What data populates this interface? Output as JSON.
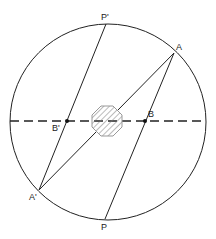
{
  "diagram": {
    "type": "geometric-optics",
    "circle": {
      "cx": 108,
      "cy": 122,
      "r": 98
    },
    "axis": {
      "y": 121,
      "x1": 10,
      "x2": 206,
      "style": "dashed"
    },
    "obstacle": {
      "shape": "octagon",
      "cx": 107,
      "cy": 121,
      "size": 30,
      "fill": "hatched"
    },
    "points": {
      "P_prime": {
        "label": "P'",
        "x": 106,
        "y": 24
      },
      "A": {
        "label": "A",
        "x": 174,
        "y": 53
      },
      "B": {
        "label": "B",
        "x": 145,
        "y": 121
      },
      "B_prime": {
        "label": "B'",
        "x": 67,
        "y": 121
      },
      "A_prime": {
        "label": "A'",
        "x": 39,
        "y": 190
      },
      "P": {
        "label": "P",
        "x": 105,
        "y": 219
      }
    },
    "segments": [
      [
        "P_prime",
        "A_prime"
      ],
      [
        "A",
        "P"
      ],
      [
        "A",
        "A_prime"
      ]
    ]
  },
  "labels": {
    "p_prime": "P'",
    "a": "A",
    "b": "B",
    "b_prime": "B'",
    "a_prime": "A'",
    "p": "P"
  }
}
